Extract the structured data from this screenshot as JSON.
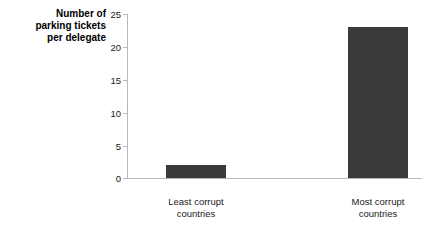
{
  "chart_data": {
    "type": "bar",
    "title": "",
    "subtitle": "",
    "xlabel": "",
    "ylabel": "Number of\nparking tickets\nper delegate",
    "categories": [
      "Least corrupt\ncountries",
      "Most corrupt\ncountries"
    ],
    "values": [
      2,
      23
    ],
    "ylim": [
      0,
      25
    ],
    "yticks": [
      0,
      5,
      10,
      15,
      20,
      25
    ],
    "ytick_labels": [
      "0",
      "5",
      "10",
      "15",
      "20",
      "25"
    ],
    "grid": false,
    "legend": null,
    "bar_color": "#3a3a3a",
    "axis_color": "#b9b9b9",
    "background": "#ffffff"
  }
}
